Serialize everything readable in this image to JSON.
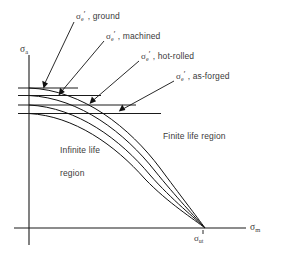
{
  "figure": {
    "type": "goodman-fatigue-diagram",
    "title": "",
    "axes": {
      "y_label_symbol": "σ",
      "y_label_subscript": "a",
      "y_label_name": "sigma-a",
      "x_label_symbol": "σ",
      "x_label_subscript": "m",
      "x_label_name": "sigma-m",
      "origin_marker": "",
      "x_intercept_symbol": "σ",
      "x_intercept_subscript": "ut",
      "x_intercept_name": "sigma-ut"
    },
    "regions": [
      {
        "id": "infinite-life",
        "line1": "Infinite life",
        "line2": "region"
      },
      {
        "id": "finite-life",
        "line1": "Finite life region",
        "line2": ""
      }
    ],
    "curves": [
      {
        "id": "ground",
        "symbol": "σ",
        "subscript": "e",
        "prime": "′",
        "separator": ",",
        "condition": "ground",
        "label_full": "σ′e , ground",
        "endurance_level": 1.0
      },
      {
        "id": "machined",
        "symbol": "σ",
        "subscript": "e",
        "prime": "′",
        "separator": ",",
        "condition": "machined",
        "label_full": "σ′e , machined",
        "endurance_level": 0.88
      },
      {
        "id": "hot-rolled",
        "symbol": "σ",
        "subscript": "e",
        "prime": "′",
        "separator": ",",
        "condition": "hot-rolled",
        "label_full": "σ′e , hot-rolled",
        "endurance_level": 0.7
      },
      {
        "id": "as-forged",
        "symbol": "σ",
        "subscript": "e",
        "prime": "′",
        "separator": ",",
        "condition": "as-forged",
        "label_full": "σ′e , as-forged",
        "endurance_level": 0.56
      }
    ],
    "colors": {
      "ink": "#111111",
      "text": "#3a3a3a",
      "background": "#ffffff"
    }
  }
}
